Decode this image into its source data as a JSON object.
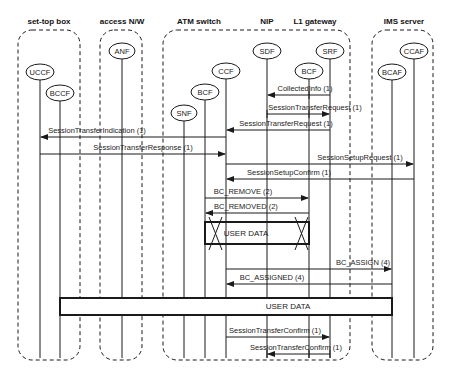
{
  "groups": [
    {
      "id": "stb",
      "label": "set-top box",
      "x": 18,
      "w": 62,
      "label_x": 49
    },
    {
      "id": "access",
      "label": "access N/W",
      "x": 100,
      "w": 42,
      "label_x": 122
    },
    {
      "id": "atm",
      "label": "ATM switch",
      "x": 163,
      "w": 187,
      "label_x": 199
    },
    {
      "id": "ims",
      "label": "IMS server",
      "x": 372,
      "w": 61,
      "label_x": 404
    }
  ],
  "extra_headers": [
    {
      "label": "NIP",
      "x": 267
    },
    {
      "label": "L1 gateway",
      "x": 315
    }
  ],
  "nodes": [
    {
      "id": "uccf",
      "label": "UCCF",
      "x": 40,
      "y": 72,
      "rx": 14
    },
    {
      "id": "bccf",
      "label": "BCCF",
      "x": 60,
      "y": 93,
      "rx": 14
    },
    {
      "id": "anf",
      "label": "ANF",
      "x": 122,
      "y": 51,
      "rx": 13
    },
    {
      "id": "snf",
      "label": "SNF",
      "x": 184,
      "y": 113,
      "rx": 13
    },
    {
      "id": "bcf_atm",
      "label": "BCF",
      "x": 205,
      "y": 92,
      "rx": 14
    },
    {
      "id": "ccf",
      "label": "CCF",
      "x": 226,
      "y": 71,
      "rx": 14
    },
    {
      "id": "sdf",
      "label": "SDF",
      "x": 267,
      "y": 51,
      "rx": 14
    },
    {
      "id": "bcf_l1",
      "label": "BCF",
      "x": 309,
      "y": 71,
      "rx": 14
    },
    {
      "id": "srf",
      "label": "SRF",
      "x": 330,
      "y": 51,
      "rx": 14
    },
    {
      "id": "bcaf",
      "label": "BCAF",
      "x": 392,
      "y": 72,
      "rx": 14
    },
    {
      "id": "ccaf",
      "label": "CCAF",
      "x": 414,
      "y": 51,
      "rx": 14
    }
  ],
  "messages": [
    {
      "label": "CollectedInfo (1)",
      "from": 330,
      "to": 267,
      "y": 95,
      "label_x": 305
    },
    {
      "label": "SessionTransferRequest (1)",
      "from": 267,
      "to": 330,
      "y": 114,
      "label_x": 315
    },
    {
      "label": "SessionTransferRequest (1)",
      "from": 330,
      "to": 226,
      "y": 130,
      "label_x": 286
    },
    {
      "label": "SessionTransferIndication (1)",
      "from": 226,
      "to": 40,
      "y": 137,
      "label_x": 97
    },
    {
      "label": "SessionTransferResponse (1)",
      "from": 40,
      "to": 226,
      "y": 154,
      "label_x": 143
    },
    {
      "label": "SessionSetupRequest (1)",
      "from": 226,
      "to": 414,
      "y": 164,
      "label_x": 360
    },
    {
      "label": "SessionSetupConfirm (1)",
      "from": 414,
      "to": 226,
      "y": 179,
      "label_x": 289
    },
    {
      "label": "BC_REMOVE (2)",
      "from": 205,
      "to": 309,
      "y": 198,
      "label_x": 243
    },
    {
      "label": "BC_REMOVED (2)",
      "from": 309,
      "to": 205,
      "y": 213,
      "label_x": 246
    },
    {
      "label": "BC_ASSIGN (4)",
      "from": 226,
      "to": 392,
      "y": 269,
      "label_x": 363
    },
    {
      "label": "BC_ASSIGNED (4)",
      "from": 392,
      "to": 226,
      "y": 284,
      "label_x": 272
    },
    {
      "label": "SessionTransferConfirm (1)",
      "from": 226,
      "to": 330,
      "y": 337,
      "label_x": 275
    },
    {
      "label": "SessionTransferConfirm (1)",
      "from": 330,
      "to": 267,
      "y": 354,
      "label_x": 296
    }
  ],
  "data_boxes": [
    {
      "label": "USER DATA",
      "x": 205,
      "y": 222,
      "w": 104,
      "h": 22,
      "crossed": true
    },
    {
      "label": "USER DATA",
      "x": 60,
      "y": 298,
      "w": 332,
      "h": 17,
      "crossed": false
    }
  ],
  "colors": {
    "line": "#1a1a1a",
    "text": "#222222",
    "background": "#ffffff"
  }
}
